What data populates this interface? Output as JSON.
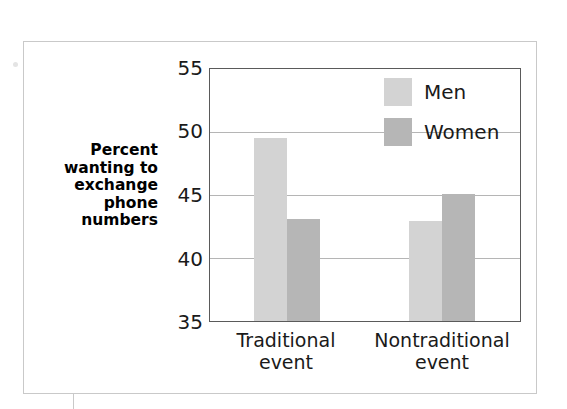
{
  "figure": {
    "background_color": "#ffffff",
    "frame_color": "#c9c9c9",
    "axis_color": "#5a5a5a",
    "gridline_color": "#b5b5b5"
  },
  "chart_data": {
    "type": "bar",
    "title": "",
    "subtitle": "",
    "xlabel": "",
    "ylabel": "Percent wanting to exchange phone numbers",
    "categories": [
      "Traditional event",
      "Nontraditional event"
    ],
    "series": [
      {
        "name": "Men",
        "values": [
          49.5,
          42.9
        ],
        "color": "#d3d3d3"
      },
      {
        "name": "Women",
        "values": [
          43.1,
          45.1
        ],
        "color": "#b6b6b6"
      }
    ],
    "ylim": [
      35,
      55
    ],
    "yticks": [
      55,
      50,
      45,
      40,
      35
    ],
    "ytick_labels": [
      "55",
      "50",
      "45",
      "40",
      "35"
    ],
    "grid": true,
    "grid_axis": "y",
    "legend_position": "top-right",
    "annotations": []
  },
  "axis": {
    "y_title_lines": [
      "Percent",
      "wanting to",
      "exchange",
      "phone",
      "numbers"
    ],
    "y_title_text": "Percent wanting to exchange phone numbers",
    "ytick_0": "55",
    "ytick_1": "50",
    "ytick_2": "45",
    "ytick_3": "40",
    "ytick_4": "35",
    "xtick_0_line_1": "Traditional",
    "xtick_0_line_2": "event",
    "xtick_1_line_1": "Nontraditional",
    "xtick_1_line_2": "event"
  },
  "legend": {
    "entries": [
      {
        "label": "Men",
        "color": "#d3d3d3"
      },
      {
        "label": "Women",
        "color": "#b6b6b6"
      }
    ],
    "entry_0_label": "Men",
    "entry_1_label": "Women"
  }
}
